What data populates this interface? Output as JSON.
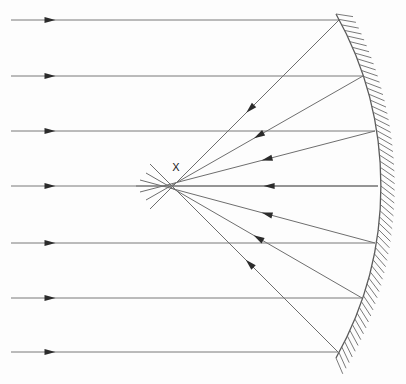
{
  "figure": {
    "width": 406,
    "height": 384,
    "background_color": "#fdfdfd",
    "line_color": "#787878",
    "mirror_color": "#5a5a5a",
    "hatch_color": "#6b6b6b",
    "arrow_color": "#2b2b2b",
    "label_color": "#1a1a1a"
  },
  "labels": {
    "focus": "X"
  },
  "focus_point": {
    "name": "focal-caustic-point",
    "x": 172,
    "y": 186,
    "label_x": 176,
    "label_y": 171
  },
  "optical_axis": {
    "y": 186
  },
  "mirror": {
    "name": "concave-mirror",
    "vertex_x": 378,
    "vertex_y": 186,
    "top_x": 336,
    "top_y": 14,
    "bottom_x": 336,
    "bottom_y": 358,
    "radius": 352,
    "center_x": 26,
    "center_y": 186,
    "hatch_count": 58,
    "hatch_length": 17
  },
  "incoming_rays": [
    {
      "id": "ray-1",
      "y": 20,
      "start_x": 11,
      "end_x": 339,
      "arrow_x": 50
    },
    {
      "id": "ray-2",
      "y": 76,
      "start_x": 11,
      "end_x": 363,
      "arrow_x": 50
    },
    {
      "id": "ray-3",
      "y": 131,
      "start_x": 11,
      "end_x": 375,
      "arrow_x": 50
    },
    {
      "id": "ray-4",
      "y": 186,
      "start_x": 11,
      "end_x": 378,
      "arrow_x": 50
    },
    {
      "id": "ray-5",
      "y": 243,
      "start_x": 11,
      "end_x": 375,
      "arrow_x": 50
    },
    {
      "id": "ray-6",
      "y": 298,
      "start_x": 11,
      "end_x": 362,
      "arrow_x": 50
    },
    {
      "id": "ray-7",
      "y": 352,
      "start_x": 11,
      "end_x": 338,
      "arrow_x": 50
    }
  ],
  "reflected_rays": [
    {
      "id": "refl-1",
      "from_x": 339,
      "from_y": 20,
      "cross_x": 172,
      "cross_y": 187,
      "to_x": 150,
      "to_y": 209,
      "arrow_t": 0.47
    },
    {
      "id": "refl-2",
      "from_x": 363,
      "from_y": 76,
      "cross_x": 173,
      "cross_y": 186,
      "to_x": 146,
      "to_y": 200,
      "arrow_t": 0.48
    },
    {
      "id": "refl-3",
      "from_x": 375,
      "from_y": 131,
      "cross_x": 174,
      "cross_y": 186,
      "to_x": 140,
      "to_y": 192,
      "arrow_t": 0.46
    },
    {
      "id": "refl-4",
      "from_x": 378,
      "from_y": 186,
      "cross_x": 175,
      "cross_y": 186,
      "to_x": 136,
      "to_y": 186,
      "arrow_t": 0.45
    },
    {
      "id": "refl-5",
      "from_x": 375,
      "from_y": 243,
      "cross_x": 174,
      "cross_y": 186,
      "to_x": 140,
      "to_y": 180,
      "arrow_t": 0.46
    },
    {
      "id": "refl-6",
      "from_x": 362,
      "from_y": 298,
      "cross_x": 173,
      "cross_y": 187,
      "to_x": 146,
      "to_y": 173,
      "arrow_t": 0.48
    },
    {
      "id": "refl-7",
      "from_x": 338,
      "from_y": 352,
      "cross_x": 172,
      "cross_y": 187,
      "to_x": 150,
      "to_y": 164,
      "arrow_t": 0.47
    }
  ],
  "chart_data": {
    "type": "diagram",
    "ray_count": 7,
    "mirror_type": "concave spherical",
    "focal_label": "X"
  }
}
